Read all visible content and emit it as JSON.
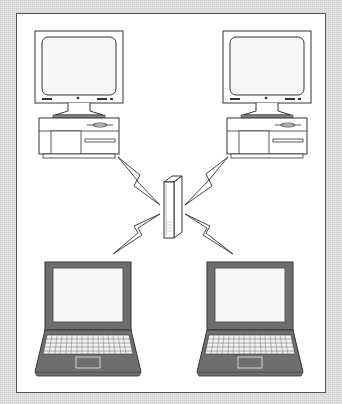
{
  "diagram": {
    "type": "wireless-network-illustration",
    "nodes": [
      {
        "id": "desktop-left",
        "kind": "desktop-computer"
      },
      {
        "id": "desktop-right",
        "kind": "desktop-computer"
      },
      {
        "id": "access-point",
        "kind": "wireless-hub"
      },
      {
        "id": "laptop-left",
        "kind": "laptop"
      },
      {
        "id": "laptop-right",
        "kind": "laptop"
      }
    ],
    "links": [
      {
        "from": "desktop-left",
        "to": "access-point",
        "style": "lightning-bolt"
      },
      {
        "from": "desktop-right",
        "to": "access-point",
        "style": "lightning-bolt"
      },
      {
        "from": "laptop-left",
        "to": "access-point",
        "style": "lightning-bolt"
      },
      {
        "from": "laptop-right",
        "to": "access-point",
        "style": "lightning-bolt"
      }
    ],
    "colors": {
      "background": "#dcdcdc",
      "frame": "#ffffff",
      "stroke": "#333333",
      "laptop_body": "#6e6e6e",
      "screen": "#f4f4f4"
    }
  }
}
